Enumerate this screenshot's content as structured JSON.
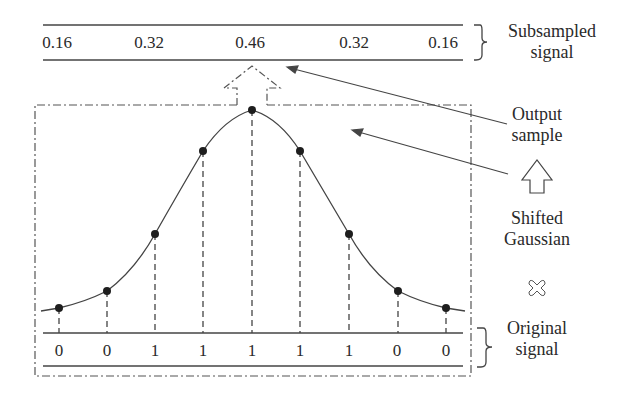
{
  "subsampled": {
    "values": [
      "0.16",
      "0.32",
      "0.46",
      "0.32",
      "0.16"
    ],
    "label_line1": "Subsampled",
    "label_line2": "signal"
  },
  "original": {
    "values": [
      "0",
      "0",
      "1",
      "1",
      "1",
      "1",
      "1",
      "0",
      "0"
    ],
    "label_line1": "Original",
    "label_line2": "signal"
  },
  "labels": {
    "output_line1": "Output",
    "output_line2": "sample",
    "gaussian_line1": "Shifted",
    "gaussian_line2": "Gaussian"
  },
  "icons": {
    "up_arrow": "up-arrow-icon",
    "multiply": "multiply-cross-icon"
  },
  "colors": {
    "line": "#3a3a3a",
    "dot": "#1e1e1e",
    "text": "#2a2a2a"
  }
}
